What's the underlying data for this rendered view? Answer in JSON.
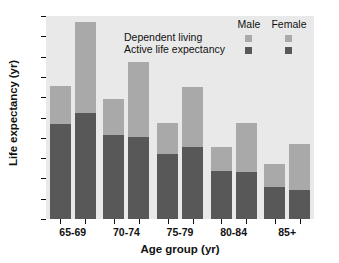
{
  "chart_data": {
    "type": "bar",
    "subtype": "stacked-grouped-bar",
    "title": "",
    "xlabel": "Age group (yr)",
    "ylabel": "Life expectancy (yr)",
    "categories": [
      "65-69",
      "70-74",
      "75-79",
      "80-84",
      "85+"
    ],
    "ylim": [
      0,
      20
    ],
    "yticks": [
      0,
      2,
      4,
      6,
      8,
      10,
      12,
      14,
      16,
      18,
      20
    ],
    "ytick_labels": [
      "0",
      "2",
      "4",
      "6",
      "8",
      "10",
      "12",
      "14",
      "16",
      "18",
      "20"
    ],
    "grid": false,
    "legend_position": "top-right-inside",
    "legend_columns": [
      "Male",
      "Female"
    ],
    "legend_rows": [
      "Dependent living",
      "Active life expectancy"
    ],
    "colors": {
      "dependent_living": "#a9a9a9",
      "active_life_expectancy": "#585858",
      "plot_background": "#e9e9e9",
      "figure_background": "#ffffff",
      "axis": "#111111"
    },
    "series": [
      {
        "name": "Male - Active life expectancy",
        "sex": "Male",
        "component": "Active life expectancy",
        "color": "#585858",
        "values": [
          9.35,
          8.25,
          6.45,
          4.75,
          3.2
        ]
      },
      {
        "name": "Male - Dependent living",
        "sex": "Male",
        "component": "Dependent living",
        "color": "#a9a9a9",
        "values": [
          3.75,
          3.6,
          3.0,
          2.35,
          2.2
        ]
      },
      {
        "name": "Female - Active life expectancy",
        "sex": "Female",
        "component": "Active life expectancy",
        "color": "#585858",
        "values": [
          10.45,
          8.05,
          7.05,
          4.6,
          2.9
        ]
      },
      {
        "name": "Female - Dependent living",
        "sex": "Female",
        "component": "Dependent living",
        "color": "#a9a9a9",
        "values": [
          8.95,
          7.45,
          6.0,
          4.85,
          4.45
        ]
      }
    ],
    "totals": {
      "male": [
        13.1,
        11.85,
        9.45,
        7.1,
        5.4
      ],
      "female": [
        19.4,
        15.5,
        13.05,
        9.45,
        7.35
      ]
    }
  },
  "axes": {
    "y": {
      "label": "Life expectancy (yr)",
      "ticks": [
        "0",
        "2",
        "4",
        "6",
        "8",
        "10",
        "12",
        "14",
        "16",
        "18",
        "20"
      ]
    },
    "x": {
      "label": "Age group (yr)",
      "ticks": [
        "65-69",
        "70-74",
        "75-79",
        "80-84",
        "85+"
      ]
    }
  },
  "legend": {
    "col_male": "Male",
    "col_female": "Female",
    "row_dependent": "Dependent living",
    "row_active": "Active life expectancy"
  }
}
